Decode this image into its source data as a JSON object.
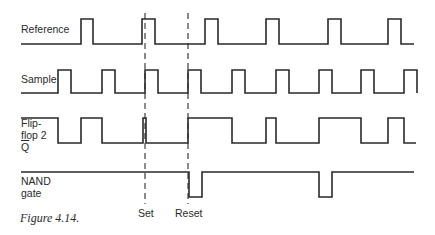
{
  "figure": {
    "caption": "Figure 4.14.",
    "signals": [
      {
        "id": "reference",
        "label_lines": [
          "Reference"
        ],
        "high_y": 19,
        "low_y": 44,
        "start_x": 21,
        "end_x": 414,
        "initial": "low",
        "transitions": [
          81,
          93,
          142,
          155,
          205,
          218,
          266,
          279,
          328,
          341,
          388,
          401
        ]
      },
      {
        "id": "sample",
        "label_lines": [
          "Sample"
        ],
        "high_y": 70,
        "low_y": 93,
        "start_x": 21,
        "end_x": 417,
        "initial": "low",
        "transitions": [
          58,
          71,
          102,
          115,
          145,
          158,
          188,
          201,
          232,
          245,
          276,
          289,
          319,
          332,
          361,
          374,
          404,
          417
        ]
      },
      {
        "id": "flipflop2-qbar",
        "label_lines": [
          "Flip-",
          "flop 2",
          "Q"
        ],
        "high_y": 118,
        "low_y": 143,
        "start_x": 21,
        "end_x": 416,
        "initial": "high",
        "transitions": [
          58,
          81,
          102,
          143,
          146,
          188,
          232,
          266,
          276,
          319,
          361,
          388,
          404
        ]
      },
      {
        "id": "nand-gate",
        "label_lines": [
          "NAND",
          "gate"
        ],
        "high_y": 172,
        "low_y": 197,
        "start_x": 21,
        "end_x": 414,
        "initial": "high",
        "transitions": [
          189,
          202,
          319,
          332
        ]
      }
    ],
    "markers": [
      {
        "id": "set",
        "label": "Set",
        "x": 145
      },
      {
        "id": "reset",
        "label": "Reset",
        "x": 188
      }
    ],
    "marker_top_y": 13,
    "marker_bottom_y": 204
  }
}
